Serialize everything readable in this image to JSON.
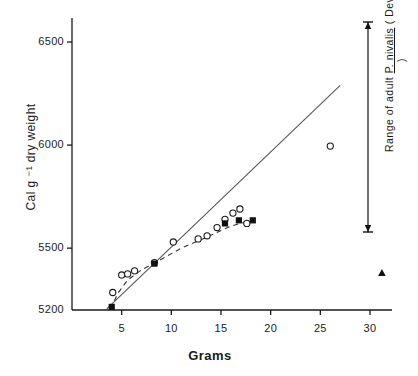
{
  "chart_data": {
    "type": "scatter",
    "title": "",
    "xlabel": "Grams",
    "ylabel": "Cal g ⁻¹ dry weight",
    "xlim": [
      0,
      32
    ],
    "ylim": [
      5200,
      6600
    ],
    "yticks": [
      5200,
      5500,
      6000,
      6500
    ],
    "ytick_labels": [
      "5200",
      "5500",
      "6000",
      "6500"
    ],
    "xticks": [
      5,
      10,
      15,
      20,
      25,
      30
    ],
    "xtick_labels": [
      "5",
      "10",
      "15",
      "20",
      "25",
      "30"
    ],
    "y_axis_broken": true,
    "grid": false,
    "legend": false,
    "series": [
      {
        "name": "open-circles",
        "marker": "open-circle",
        "points": [
          {
            "x": 4.1,
            "y": 5285
          },
          {
            "x": 5.0,
            "y": 5370
          },
          {
            "x": 5.6,
            "y": 5375
          },
          {
            "x": 6.3,
            "y": 5390
          },
          {
            "x": 8.3,
            "y": 5430
          },
          {
            "x": 10.2,
            "y": 5530
          },
          {
            "x": 12.7,
            "y": 5545
          },
          {
            "x": 13.6,
            "y": 5560
          },
          {
            "x": 14.6,
            "y": 5600
          },
          {
            "x": 15.4,
            "y": 5640
          },
          {
            "x": 16.2,
            "y": 5670
          },
          {
            "x": 16.9,
            "y": 5690
          },
          {
            "x": 17.6,
            "y": 5620
          },
          {
            "x": 26.0,
            "y": 5995
          }
        ]
      },
      {
        "name": "filled-squares",
        "marker": "filled-square",
        "points": [
          {
            "x": 4.0,
            "y": 5215
          },
          {
            "x": 8.3,
            "y": 5425
          },
          {
            "x": 15.4,
            "y": 5620
          },
          {
            "x": 16.8,
            "y": 5635
          },
          {
            "x": 18.2,
            "y": 5635
          }
        ]
      },
      {
        "name": "filled-triangle",
        "marker": "filled-triangle",
        "points": [
          {
            "x": 31.2,
            "y": 5380
          }
        ]
      }
    ],
    "fits": [
      {
        "name": "solid-regression-line",
        "style": "solid",
        "x0": 3.5,
        "y0": 5205,
        "x1": 27.0,
        "y1": 6290
      },
      {
        "name": "dashed-curve",
        "style": "dashed",
        "path": [
          {
            "x": 3.9,
            "y": 5205
          },
          {
            "x": 4.6,
            "y": 5280
          },
          {
            "x": 5.6,
            "y": 5345
          },
          {
            "x": 7.0,
            "y": 5395
          },
          {
            "x": 8.4,
            "y": 5430
          },
          {
            "x": 11.0,
            "y": 5500
          },
          {
            "x": 13.5,
            "y": 5552
          },
          {
            "x": 16.0,
            "y": 5607
          },
          {
            "x": 18.3,
            "y": 5638
          }
        ]
      }
    ],
    "annotations": [
      {
        "name": "range-bar",
        "kind": "double-arrow-vertical",
        "x": 31.2,
        "y_top": 6575,
        "y_bottom": 5500,
        "text_line1": "Range of adult",
        "text_species": "P. nivalis",
        "text_line2": "( Devon  Is. )",
        "text_full": "Range of adult  P. nivalis  ( Devon Is. )"
      }
    ],
    "colors": {
      "ink": "#1a1a1a",
      "background": "#ffffff"
    }
  }
}
